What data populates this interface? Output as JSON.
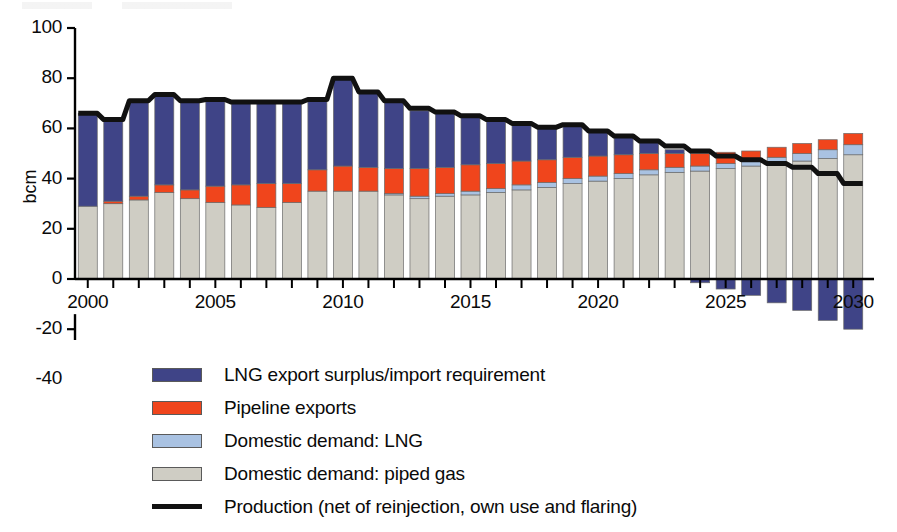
{
  "axis": {
    "ylabel": "bcm",
    "yticks": [
      100,
      80,
      60,
      40,
      20,
      0,
      -20,
      -40
    ],
    "ytick_labels": [
      "100",
      "80",
      "60",
      "40",
      "20",
      "0",
      "-20",
      "-40"
    ],
    "xtick_labels": [
      "2000",
      "2005",
      "2010",
      "2015",
      "2020",
      "2025",
      "2030"
    ],
    "xtick_years": [
      2000,
      2005,
      2010,
      2015,
      2020,
      2025,
      2030
    ]
  },
  "legend": {
    "items": [
      {
        "label": "LNG export surplus/import requirement",
        "color": "#3f4487",
        "type": "swatch",
        "key": "lng_export_surplus"
      },
      {
        "label": "Pipeline exports",
        "color": "#f0451c",
        "type": "swatch",
        "key": "pipeline_exports"
      },
      {
        "label": "Domestic demand: LNG",
        "color": "#a9c2e2",
        "type": "swatch",
        "key": "domestic_lng"
      },
      {
        "label": "Domestic demand: piped gas",
        "color": "#cfcdc4",
        "type": "swatch",
        "key": "domestic_piped"
      },
      {
        "label": "Production (net of reinjection, own use and flaring)",
        "color": "#111111",
        "type": "line",
        "key": "production"
      }
    ]
  },
  "chart_data": {
    "type": "bar",
    "title": "",
    "subtitle": "",
    "xlabel": "",
    "ylabel": "bcm",
    "ylim": [
      -40,
      100
    ],
    "xlim": [
      1999.5,
      2030.5
    ],
    "grid": false,
    "legend_position": "bottom",
    "stacked": true,
    "categories": [
      2000,
      2001,
      2002,
      2003,
      2004,
      2005,
      2006,
      2007,
      2008,
      2009,
      2010,
      2011,
      2012,
      2013,
      2014,
      2015,
      2016,
      2017,
      2018,
      2019,
      2020,
      2021,
      2022,
      2023,
      2024,
      2025,
      2026,
      2027,
      2028,
      2029,
      2030
    ],
    "series": [
      {
        "name": "Domestic demand: piped gas",
        "color": "#cfcdc4",
        "values": [
          29.0,
          30.0,
          31.5,
          34.5,
          32.0,
          30.5,
          29.5,
          28.5,
          30.5,
          35.0,
          35.0,
          35.0,
          33.5,
          32.0,
          33.0,
          33.5,
          34.5,
          35.5,
          36.5,
          38.0,
          39.0,
          40.0,
          41.5,
          42.5,
          43.0,
          44.0,
          45.0,
          46.0,
          47.0,
          48.0,
          49.5
        ]
      },
      {
        "name": "Domestic demand: LNG",
        "color": "#a9c2e2",
        "values": [
          0.0,
          0.0,
          0.0,
          0.0,
          0.0,
          0.0,
          0.0,
          0.0,
          0.0,
          0.0,
          0.0,
          0.0,
          0.5,
          1.0,
          1.0,
          1.5,
          1.5,
          2.0,
          2.0,
          2.0,
          2.0,
          2.0,
          2.0,
          2.0,
          2.0,
          2.0,
          2.0,
          2.5,
          3.0,
          3.5,
          4.0
        ]
      },
      {
        "name": "Pipeline exports",
        "color": "#f0451c",
        "values": [
          0.0,
          1.0,
          1.5,
          3.0,
          3.5,
          6.5,
          8.0,
          9.5,
          7.5,
          8.5,
          10.0,
          9.5,
          10.0,
          11.0,
          10.5,
          10.5,
          10.0,
          9.5,
          9.0,
          8.5,
          8.0,
          7.5,
          6.5,
          5.5,
          5.0,
          4.5,
          4.0,
          4.0,
          4.0,
          4.0,
          4.5
        ]
      },
      {
        "name": "LNG export surplus/import requirement",
        "color": "#3f4487",
        "values": [
          37.0,
          32.5,
          38.0,
          36.0,
          35.5,
          34.5,
          33.0,
          32.5,
          32.5,
          28.0,
          34.5,
          30.0,
          27.0,
          23.0,
          22.0,
          19.5,
          17.0,
          15.0,
          13.5,
          12.5,
          10.0,
          7.5,
          5.0,
          1.5,
          -1.5,
          -4.0,
          -6.5,
          -9.5,
          -12.5,
          -16.5,
          -20.0
        ]
      }
    ],
    "line_series": {
      "name": "Production (net of reinjection, own use and flaring)",
      "color": "#111111",
      "values": [
        66.0,
        63.5,
        71.0,
        73.5,
        71.0,
        71.5,
        70.5,
        70.5,
        70.5,
        71.5,
        80.0,
        74.5,
        71.0,
        68.0,
        66.5,
        65.0,
        63.5,
        62.0,
        60.5,
        61.5,
        59.0,
        57.0,
        55.0,
        53.0,
        51.0,
        49.0,
        47.5,
        46.0,
        44.5,
        42.0,
        38.0
      ]
    }
  }
}
